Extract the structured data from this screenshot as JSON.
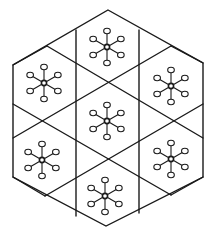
{
  "diagram": {
    "colors": {
      "line": "#1a1a1a",
      "background": "#ffffff"
    },
    "outer_hexagon": [
      [
        108,
        10
      ],
      [
        203,
        63
      ],
      [
        203,
        177
      ],
      [
        106,
        226
      ],
      [
        13,
        177
      ],
      [
        13,
        65
      ]
    ],
    "grid_lines": [
      [
        [
          76,
          30
        ],
        [
          76,
          216
        ]
      ],
      [
        [
          139,
          30
        ],
        [
          139,
          213
        ]
      ],
      [
        [
          47,
          46
        ],
        [
          203,
          138
        ]
      ],
      [
        [
          13,
          104
        ],
        [
          203,
          104
        ]
      ],
      [
        [
          171,
          46
        ],
        [
          13,
          138
        ]
      ],
      [
        [
          13,
          138
        ],
        [
          171,
          228
        ]
      ],
      [
        [
          47,
          193
        ],
        [
          203,
          104
        ]
      ]
    ],
    "molecules": [
      {
        "name": "top",
        "center": [
          107,
          47
        ]
      },
      {
        "name": "upper-left",
        "center": [
          44,
          83
        ]
      },
      {
        "name": "upper-right",
        "center": [
          171,
          86
        ]
      },
      {
        "name": "center",
        "center": [
          107,
          121
        ]
      },
      {
        "name": "lower-left",
        "center": [
          42,
          160
        ]
      },
      {
        "name": "lower-right",
        "center": [
          171,
          159
        ]
      },
      {
        "name": "bottom",
        "center": [
          105,
          196
        ]
      }
    ],
    "arm_length": 16
  }
}
